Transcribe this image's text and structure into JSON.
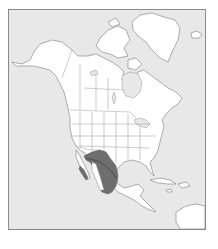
{
  "map": {
    "type": "range-map",
    "region": "North America",
    "colors": {
      "ocean": "#e8e8e8",
      "land": "#ffffff",
      "outline": "#7a7a7a",
      "range": "#6e6e6e",
      "frame": "#8a8a8a"
    },
    "highlighted_range": {
      "description": "Shaded species range across northern Mexico and southwestern United States",
      "areas": [
        "Southwestern United States",
        "Northern and central Mexico",
        "Baja California coast"
      ]
    }
  }
}
